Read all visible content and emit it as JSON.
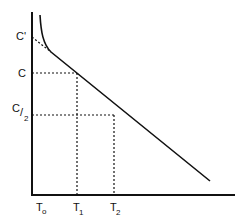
{
  "diagram": {
    "y_labels": {
      "c_prime": "C'",
      "c": "C",
      "c_half_num": "C",
      "c_half_den": "2"
    },
    "x_labels": {
      "t0": "T",
      "t0_sub": "o",
      "t1": "T",
      "t1_sub": "1",
      "t2": "T",
      "t2_sub": "2"
    },
    "colors": {
      "line": "#111111",
      "background": "#ffffff"
    }
  }
}
